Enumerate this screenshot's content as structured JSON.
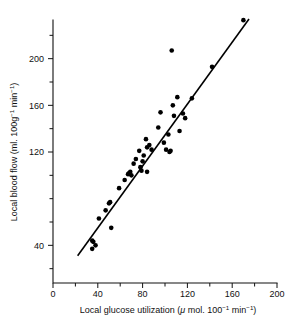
{
  "chart_data": {
    "type": "scatter",
    "title": "",
    "xlabel": "Local glucose utilization (μ mol. 100⁻¹ min⁻¹)",
    "ylabel": "Local blood flow (ml. 100g⁻¹ min⁻¹)",
    "xlabel_parts": {
      "main": "Local glucose utilization (",
      "mu": "μ",
      "mol": " mol. 100",
      "sup1": "−1",
      "min": " min",
      "sup2": "−1",
      "close": ")"
    },
    "ylabel_parts": {
      "main": "Local blood flow (ml. 100g",
      "sup1": "−1",
      "min": " min",
      "sup2": "−1",
      "close": ")"
    },
    "xlim": [
      0,
      200
    ],
    "ylim": [
      0,
      240
    ],
    "x_ticks": [
      0,
      20,
      40,
      60,
      80,
      100,
      120,
      140,
      160,
      180,
      200
    ],
    "x_tick_labels": [
      "0",
      "",
      "40",
      "",
      "80",
      "",
      "120",
      "",
      "160",
      "",
      "200"
    ],
    "y_ticks": [
      0,
      20,
      40,
      60,
      80,
      100,
      120,
      140,
      160,
      180,
      200,
      220,
      240
    ],
    "y_tick_labels": [
      "0",
      "",
      "40",
      "",
      "",
      "",
      "120",
      "",
      "160",
      "",
      "200",
      "",
      ""
    ],
    "grid": false,
    "legend": "none",
    "series": [
      {
        "name": "Local blood flow vs local glucose utilization",
        "marker": "filled-circle",
        "color": "#000000",
        "points": [
          [
            35,
            44
          ],
          [
            36,
            43
          ],
          [
            35,
            37
          ],
          [
            38,
            40
          ],
          [
            41,
            63
          ],
          [
            47,
            70
          ],
          [
            50,
            76
          ],
          [
            51,
            77
          ],
          [
            52,
            55
          ],
          [
            59,
            89
          ],
          [
            64,
            96
          ],
          [
            67,
            101
          ],
          [
            68,
            102
          ],
          [
            69,
            103
          ],
          [
            70,
            100
          ],
          [
            72,
            110
          ],
          [
            74,
            114
          ],
          [
            77,
            121
          ],
          [
            78,
            107
          ],
          [
            79,
            104
          ],
          [
            80,
            112
          ],
          [
            81,
            117
          ],
          [
            83,
            131
          ],
          [
            84,
            124
          ],
          [
            84,
            103
          ],
          [
            86,
            126
          ],
          [
            88,
            122
          ],
          [
            94,
            141
          ],
          [
            96,
            154
          ],
          [
            99,
            128
          ],
          [
            101,
            122
          ],
          [
            103,
            135
          ],
          [
            104,
            120
          ],
          [
            105,
            121
          ],
          [
            106,
            207
          ],
          [
            107,
            160
          ],
          [
            108,
            151
          ],
          [
            111,
            167
          ],
          [
            113,
            138
          ],
          [
            116,
            153
          ],
          [
            118,
            149
          ],
          [
            124,
            166
          ],
          [
            142,
            193
          ],
          [
            170,
            233
          ]
        ]
      }
    ],
    "fit_line": {
      "name": "regression line",
      "x_start": 22,
      "y_start": 31,
      "x_end": 175,
      "y_end": 234,
      "color": "#000000"
    }
  }
}
